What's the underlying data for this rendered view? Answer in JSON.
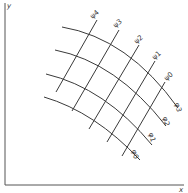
{
  "diagram": {
    "type": "curvilinear-coordinate-grid",
    "colors": {
      "ink": "#3a3a3a",
      "axis": "#555555",
      "background": "#ffffff"
    },
    "axes": {
      "x_label": "x",
      "y_label": "y"
    },
    "psi_curves": [
      {
        "label": "ψ0",
        "path": "M165,82 L122,156",
        "label_x": 170,
        "label_y": 78,
        "rotate": -40
      },
      {
        "label": "ψ1",
        "path": "M155,61 L107,142",
        "label_x": 158,
        "label_y": 57,
        "rotate": -40
      },
      {
        "label": "ψ2",
        "path": "M139,45 L89,129",
        "label_x": 140,
        "label_y": 41,
        "rotate": -40
      },
      {
        "label": "ψ3",
        "path": "M119,30 L72,111",
        "label_x": 119,
        "label_y": 25,
        "rotate": -40
      },
      {
        "label": "ψ4",
        "path": "M97,20 L56,92",
        "label_x": 96,
        "label_y": 16,
        "rotate": -40
      }
    ],
    "phi_curves": [
      {
        "label": "φ0",
        "path": "M44,97 Q95,112 140,160",
        "label_x": 133,
        "label_y": 155,
        "rotate": 75
      },
      {
        "label": "φ1",
        "path": "M46,74 Q105,88 152,145",
        "label_x": 150,
        "label_y": 138,
        "rotate": 75
      },
      {
        "label": "φ2",
        "path": "M55,50 Q116,62 166,126",
        "label_x": 164,
        "label_y": 122,
        "rotate": 75
      },
      {
        "label": "φ3",
        "path": "M62,27 Q128,38 178,108",
        "label_x": 176,
        "label_y": 108,
        "rotate": 75
      }
    ]
  }
}
